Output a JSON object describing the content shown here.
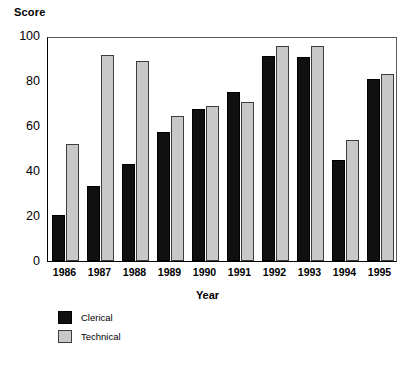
{
  "chart_data": {
    "type": "bar",
    "title": "",
    "ylabel": "Score",
    "xlabel": "Year",
    "categories": [
      "1986",
      "1987",
      "1988",
      "1989",
      "1990",
      "1991",
      "1992",
      "1993",
      "1994",
      "1995"
    ],
    "series": [
      {
        "name": "Clerical",
        "color": "#101010",
        "values": [
          20.5,
          33.5,
          43,
          57.5,
          67.5,
          75,
          91,
          90.5,
          45,
          81
        ]
      },
      {
        "name": "Technical",
        "color": "#c8c8c8",
        "values": [
          52,
          91.5,
          89,
          64.5,
          69,
          70.5,
          95.5,
          95.5,
          54,
          83
        ]
      }
    ],
    "ylim": [
      0,
      100
    ],
    "yticks": [
      "0",
      "20",
      "40",
      "60",
      "80",
      "100"
    ],
    "ytick_values": [
      0,
      20,
      40,
      60,
      80,
      100
    ],
    "grid": false,
    "legend_position": "below-left"
  },
  "legend": {
    "items": [
      {
        "label": "Clerical"
      },
      {
        "label": "Technical"
      }
    ]
  }
}
